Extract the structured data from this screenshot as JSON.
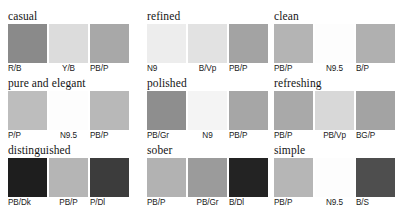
{
  "page": {
    "background": "#ffffff",
    "title_font_color": "#141414",
    "label_font_color": "#1a1a1a"
  },
  "groups": [
    {
      "name": "casual",
      "swatches": [
        {
          "label": "R/B",
          "color": "#8a8a8a"
        },
        {
          "label": "Y/B",
          "color": "#dcdcdc"
        },
        {
          "label": "PB/P",
          "color": "#a8a8a8"
        }
      ]
    },
    {
      "name": "refined",
      "swatches": [
        {
          "label": "N9",
          "color": "#ededed"
        },
        {
          "label": "B/Vp",
          "color": "#e2e2e2"
        },
        {
          "label": "PB/P",
          "color": "#a3a3a3"
        }
      ]
    },
    {
      "name": "clean",
      "swatches": [
        {
          "label": "PB/P",
          "color": "#b4b4b4"
        },
        {
          "label": "N9.5",
          "color": "#fdfdfd"
        },
        {
          "label": "B/P",
          "color": "#b0b0b0"
        }
      ]
    },
    {
      "name": "pure and elegant",
      "swatches": [
        {
          "label": "P/P",
          "color": "#bdbdbd"
        },
        {
          "label": "N9.5",
          "color": "#fdfdfd"
        },
        {
          "label": "PB/P",
          "color": "#b8b8b8"
        }
      ]
    },
    {
      "name": "polished",
      "swatches": [
        {
          "label": "PB/Gr",
          "color": "#8e8e8e"
        },
        {
          "label": "N9",
          "color": "#f4f4f4"
        },
        {
          "label": "PB/P",
          "color": "#a6a6a6"
        }
      ]
    },
    {
      "name": "refreshing",
      "swatches": [
        {
          "label": "PB/P",
          "color": "#a9a9a9"
        },
        {
          "label": "PB/Vp",
          "color": "#d8d8d8"
        },
        {
          "label": "BG/P",
          "color": "#a3a3a3"
        }
      ]
    },
    {
      "name": "distinguished",
      "swatches": [
        {
          "label": "PB/Dk",
          "color": "#1e1e1e"
        },
        {
          "label": "PB/P",
          "color": "#b5b5b5"
        },
        {
          "label": "P/Dl",
          "color": "#3c3c3c"
        }
      ]
    },
    {
      "name": "sober",
      "swatches": [
        {
          "label": "PB/P",
          "color": "#b2b2b2"
        },
        {
          "label": "PB/Gr",
          "color": "#9b9b9b"
        },
        {
          "label": "B/Dl",
          "color": "#232323"
        }
      ]
    },
    {
      "name": "simple",
      "swatches": [
        {
          "label": "PB/P",
          "color": "#b6b6b6"
        },
        {
          "label": "N9.5",
          "color": "#fdfdfd"
        },
        {
          "label": "B/S",
          "color": "#4e4e4e"
        }
      ]
    }
  ]
}
